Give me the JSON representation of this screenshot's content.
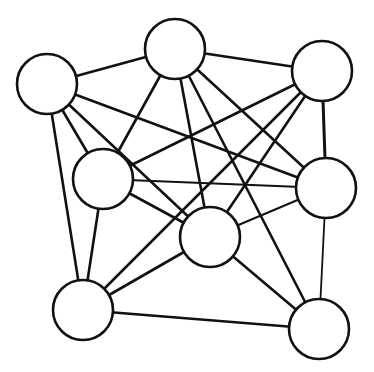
{
  "diagram": {
    "type": "undirected-graph",
    "width": 374,
    "height": 372,
    "colors": {
      "background": "#ffffff",
      "stroke": "#111111",
      "node_fill": "#ffffff"
    },
    "node_radius": 30,
    "node_stroke_width": 2.6,
    "edge_stroke_width": 2.5,
    "nodes": [
      {
        "id": "A",
        "x": 47,
        "y": 84
      },
      {
        "id": "B",
        "x": 175,
        "y": 49
      },
      {
        "id": "C",
        "x": 322,
        "y": 71
      },
      {
        "id": "D",
        "x": 103,
        "y": 179
      },
      {
        "id": "E",
        "x": 326,
        "y": 188
      },
      {
        "id": "F",
        "x": 210,
        "y": 237
      },
      {
        "id": "G",
        "x": 83,
        "y": 310
      },
      {
        "id": "H",
        "x": 319,
        "y": 329
      }
    ],
    "edges": [
      {
        "from": "A",
        "to": "B",
        "w": 2.6
      },
      {
        "from": "A",
        "to": "D",
        "w": 2.6
      },
      {
        "from": "A",
        "to": "E",
        "w": 2.6
      },
      {
        "from": "A",
        "to": "F",
        "w": 2.6
      },
      {
        "from": "A",
        "to": "G",
        "w": 2.6
      },
      {
        "from": "B",
        "to": "C",
        "w": 2.6
      },
      {
        "from": "B",
        "to": "D",
        "w": 2.6
      },
      {
        "from": "B",
        "to": "E",
        "w": 2.6
      },
      {
        "from": "B",
        "to": "F",
        "w": 2.6
      },
      {
        "from": "B",
        "to": "H",
        "w": 2.6
      },
      {
        "from": "C",
        "to": "D",
        "w": 2.6
      },
      {
        "from": "C",
        "to": "E",
        "w": 3.0
      },
      {
        "from": "C",
        "to": "F",
        "w": 2.6
      },
      {
        "from": "C",
        "to": "G",
        "w": 2.6
      },
      {
        "from": "D",
        "to": "E",
        "w": 2.0
      },
      {
        "from": "D",
        "to": "F",
        "w": 2.6
      },
      {
        "from": "D",
        "to": "G",
        "w": 2.6
      },
      {
        "from": "E",
        "to": "F",
        "w": 2.0
      },
      {
        "from": "E",
        "to": "H",
        "w": 1.8
      },
      {
        "from": "F",
        "to": "G",
        "w": 2.6
      },
      {
        "from": "F",
        "to": "H",
        "w": 2.6
      },
      {
        "from": "G",
        "to": "H",
        "w": 2.6
      }
    ]
  }
}
